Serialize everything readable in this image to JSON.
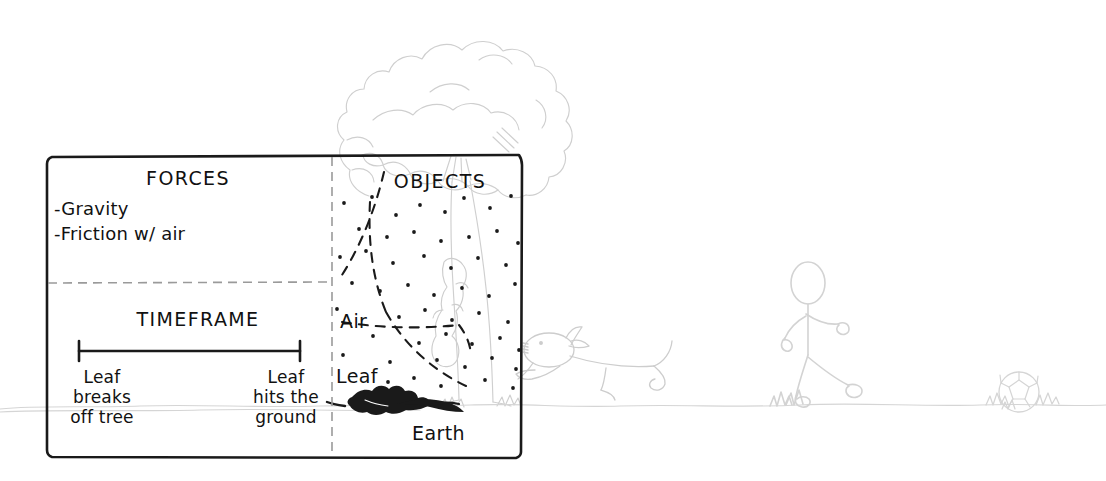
{
  "diagram": {
    "title_absent": "",
    "panels": {
      "forces": {
        "heading": "FORCES",
        "items": [
          "-Gravity",
          "-Friction w/ air"
        ]
      },
      "timeframe": {
        "heading": "TIMEFRAME",
        "start_label": "Leaf\nbreaks\noff tree",
        "end_label": "Leaf\nhits the\nground"
      },
      "objects": {
        "heading": "OBJECTS",
        "labels": [
          "Air",
          "Leaf",
          "Earth"
        ]
      }
    },
    "scene_elements": {
      "tree": "tree-drawing",
      "falling_leaf": "falling-leaf-drawing",
      "fallen_leaf": "fallen-leaf-silhouette",
      "ground": "ground-line",
      "dog_figure": "lying-dog-figure",
      "person_figure": "walking-stick-figure",
      "ball": "soccer-ball"
    },
    "colors": {
      "ink": "#111111",
      "sketch_gray": "#c9c9c9",
      "sketch_gray_light": "#d8d8d8",
      "divider_gray": "#9a9a9a",
      "background": "#ffffff"
    }
  }
}
